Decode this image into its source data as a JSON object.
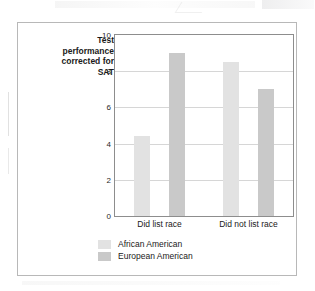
{
  "figure": {
    "axis_title_lines": [
      "Test",
      "performance",
      "corrected for",
      "SAT"
    ],
    "axis_title_full": "Test performance corrected for SAT"
  },
  "chart_data": {
    "type": "bar",
    "title": "",
    "subtitle": "",
    "xlabel": "",
    "ylabel": "Test performance corrected for SAT",
    "categories": [
      "Did list race",
      "Did not list race"
    ],
    "series": [
      {
        "name": "African American",
        "values": [
          4.4,
          8.5
        ],
        "color": "#e2e2e2"
      },
      {
        "name": "European American",
        "values": [
          9.0,
          7.0
        ],
        "color": "#c9c9c9"
      }
    ],
    "ylim": [
      0,
      10
    ],
    "yticks": [
      0,
      2,
      4,
      6,
      8,
      10
    ],
    "ytick_labels": [
      "0",
      "2",
      "4",
      "6",
      "8",
      "10"
    ],
    "grid": "horizontal",
    "legend_position": "bottom-center"
  }
}
